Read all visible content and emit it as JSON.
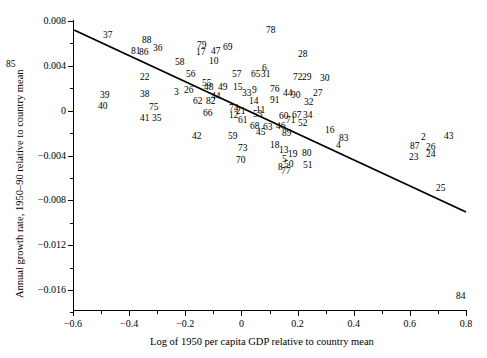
{
  "axes": {
    "x": {
      "label": "Log of 1950 per capita GDP relative to country mean",
      "ticks": [
        "-0.6",
        "-0.4",
        "-0.2",
        "0",
        "0.2",
        "0.4",
        "0.6",
        "0.8"
      ],
      "tickvalues": [
        -0.6,
        -0.4,
        -0.2,
        0,
        0.2,
        0.4,
        0.6,
        0.8
      ],
      "min": -0.6,
      "max": 0.8
    },
    "y": {
      "label": "Annual growth rate, 1950–90 relative to country mean",
      "ticks": [
        "0.008",
        "0.004",
        "0",
        "-0.004",
        "-0.008",
        "-0.012",
        "-0.016"
      ],
      "tickvalues": [
        0.008,
        0.004,
        0,
        -0.004,
        -0.008,
        -0.012,
        -0.016
      ],
      "min": -0.018,
      "max": 0.008
    }
  },
  "chart_data": {
    "type": "scatter",
    "title": "",
    "xlabel": "Log of 1950 per capita GDP relative to country mean",
    "ylabel": "Annual growth rate, 1950–90 relative to country mean",
    "xlim": [
      -0.6,
      0.8
    ],
    "ylim": [
      -0.018,
      0.008
    ],
    "grid": false,
    "legend": null,
    "marker_style": "numeric-label",
    "fit_line": {
      "type": "linear-regression",
      "x": [
        -0.6,
        0.8
      ],
      "y": [
        0.0065,
        -0.0098
      ],
      "slope": -0.01164,
      "intercept": -0.0017
    },
    "points": [
      {
        "label": "85",
        "x": -0.593,
        "y": 0.0043
      },
      {
        "label": "37",
        "x": -0.474,
        "y": 0.007
      },
      {
        "label": "81",
        "x": -0.402,
        "y": 0.0055
      },
      {
        "label": "88",
        "x": -0.366,
        "y": 0.0063
      },
      {
        "label": "86",
        "x": -0.377,
        "y": 0.0053
      },
      {
        "label": "36",
        "x": -0.345,
        "y": 0.0055
      },
      {
        "label": "22",
        "x": -0.373,
        "y": 0.0032
      },
      {
        "label": "58",
        "x": -0.302,
        "y": 0.0047
      },
      {
        "label": "79",
        "x": -0.259,
        "y": 0.0059
      },
      {
        "label": "17",
        "x": -0.256,
        "y": 0.0053
      },
      {
        "label": "47",
        "x": -0.227,
        "y": 0.0053
      },
      {
        "label": "69",
        "x": -0.202,
        "y": 0.0056
      },
      {
        "label": "10",
        "x": -0.231,
        "y": 0.0046
      },
      {
        "label": "39",
        "x": -0.48,
        "y": 0.0012
      },
      {
        "label": "40",
        "x": -0.484,
        "y": 0.0003
      },
      {
        "label": "38",
        "x": -0.373,
        "y": 0.0013
      },
      {
        "label": "75",
        "x": -0.355,
        "y": -0.0006
      },
      {
        "label": "41",
        "x": -0.373,
        "y": -0.0016
      },
      {
        "label": "35",
        "x": -0.348,
        "y": -0.0016
      },
      {
        "label": "56",
        "x": -0.291,
        "y": 0.0037
      },
      {
        "label": "55",
        "x": -0.259,
        "y": 0.003
      },
      {
        "label": "3",
        "x": -0.302,
        "y": 0.0014
      },
      {
        "label": "26",
        "x": -0.277,
        "y": 0.0013
      },
      {
        "label": "57",
        "x": -0.166,
        "y": 0.0037
      },
      {
        "label": "6",
        "x": -0.105,
        "y": 0.0041
      },
      {
        "label": "65",
        "x": -0.127,
        "y": 0.0036
      },
      {
        "label": "31",
        "x": -0.108,
        "y": 0.0036
      },
      {
        "label": "28",
        "x": -0.033,
        "y": 0.0049
      },
      {
        "label": "78",
        "x": -0.072,
        "y": 0.0076
      },
      {
        "label": "48",
        "x": -0.188,
        "y": 0.0023
      },
      {
        "label": "49",
        "x": -0.159,
        "y": 0.0023
      },
      {
        "label": "15",
        "x": -0.13,
        "y": 0.0023
      },
      {
        "label": "44",
        "x": -0.173,
        "y": 0.0013
      },
      {
        "label": "62",
        "x": -0.209,
        "y": 0.0007
      },
      {
        "label": "82",
        "x": -0.184,
        "y": 0.0007
      },
      {
        "label": "66",
        "x": -0.191,
        "y": -0.0004
      },
      {
        "label": "33",
        "x": -0.112,
        "y": 0.0016
      },
      {
        "label": "9",
        "x": -0.094,
        "y": 0.0019
      },
      {
        "label": "76",
        "x": -0.058,
        "y": 0.0021
      },
      {
        "label": "14",
        "x": -0.098,
        "y": 0.0009
      },
      {
        "label": "91",
        "x": -0.058,
        "y": 0.001
      },
      {
        "label": "44b",
        "x": -0.033,
        "y": 0.0016
      },
      {
        "label": "74",
        "x": -0.141,
        "y": 0.0001
      },
      {
        "label": "21",
        "x": -0.127,
        "y": -0.0003
      },
      {
        "label": "11",
        "x": -0.087,
        "y": -0.0002
      },
      {
        "label": "12",
        "x": -0.141,
        "y": -0.0008
      },
      {
        "label": "61",
        "x": -0.123,
        "y": -0.0012
      },
      {
        "label": "72",
        "x": 0.008,
        "y": 0.0035
      },
      {
        "label": "29",
        "x": 0.026,
        "y": 0.0035
      },
      {
        "label": "30",
        "x": 0.062,
        "y": 0.0034
      },
      {
        "label": "90",
        "x": 0.004,
        "y": 0.0013
      },
      {
        "label": "27",
        "x": 0.048,
        "y": 0.0014
      },
      {
        "label": "32",
        "x": 0.03,
        "y": 0.0007
      },
      {
        "label": "53",
        "x": -0.051,
        "y": -0.0004
      },
      {
        "label": "60",
        "x": 0.001,
        "y": -0.0008
      },
      {
        "label": "67",
        "x": 0.026,
        "y": -0.0007
      },
      {
        "label": "34",
        "x": 0.048,
        "y": -0.0007
      },
      {
        "label": "52",
        "x": 0.037,
        "y": -0.0013
      },
      {
        "label": "68",
        "x": -0.04,
        "y": -0.0016
      },
      {
        "label": "63",
        "x": -0.015,
        "y": -0.0017
      },
      {
        "label": "46",
        "x": 0.012,
        "y": -0.0016
      },
      {
        "label": "89",
        "x": 0.026,
        "y": -0.0021
      },
      {
        "label": "45",
        "x": -0.026,
        "y": -0.0021
      },
      {
        "label": "42",
        "x": -0.184,
        "y": -0.0027
      },
      {
        "label": "59",
        "x": -0.112,
        "y": -0.0027
      },
      {
        "label": "73",
        "x": -0.091,
        "y": -0.0036
      },
      {
        "label": "70",
        "x": -0.094,
        "y": -0.0046
      },
      {
        "label": "18",
        "x": -0.026,
        "y": -0.0032
      },
      {
        "label": "13",
        "x": -0.008,
        "y": -0.0036
      },
      {
        "label": "5",
        "x": -0.001,
        "y": -0.0044
      },
      {
        "label": "19",
        "x": 0.012,
        "y": -0.0039
      },
      {
        "label": "80",
        "x": 0.041,
        "y": -0.0038
      },
      {
        "label": "8",
        "x": -0.008,
        "y": -0.0053
      },
      {
        "label": "50",
        "x": 0.004,
        "y": -0.0051
      },
      {
        "label": "77",
        "x": -0.001,
        "y": -0.0057
      },
      {
        "label": "51",
        "x": 0.041,
        "y": -0.0052
      },
      {
        "label": "16",
        "x": 0.126,
        "y": -0.0017
      },
      {
        "label": "83",
        "x": 0.155,
        "y": -0.0026
      },
      {
        "label": "4",
        "x": 0.148,
        "y": -0.0032
      },
      {
        "label": "2",
        "x": 0.383,
        "y": -0.0025
      },
      {
        "label": "43",
        "x": 0.433,
        "y": -0.0025
      },
      {
        "label": "87",
        "x": 0.354,
        "y": -0.0033
      },
      {
        "label": "26b",
        "x": 0.39,
        "y": -0.0034
      },
      {
        "label": "23",
        "x": 0.354,
        "y": -0.0042
      },
      {
        "label": "24",
        "x": 0.39,
        "y": -0.0041
      },
      {
        "label": "25",
        "x": 0.408,
        "y": -0.0071
      },
      {
        "label": "84",
        "x": 0.73,
        "y": -0.017
      },
      {
        "label": "71",
        "x": 0.012,
        "y": -0.0011
      },
      {
        "label": "7",
        "x": -0.141,
        "y": 0.0002
      }
    ]
  },
  "labels_rendered": [
    {
      "t": "85",
      "x": 6,
      "y": 60
    },
    {
      "t": "37",
      "x": 103,
      "y": 31
    },
    {
      "t": "81",
      "x": 131,
      "y": 47
    },
    {
      "t": "88",
      "x": 142,
      "y": 36
    },
    {
      "t": "86",
      "x": 139,
      "y": 48
    },
    {
      "t": "36",
      "x": 153,
      "y": 44
    },
    {
      "t": "22",
      "x": 140,
      "y": 73
    },
    {
      "t": "58",
      "x": 175,
      "y": 58
    },
    {
      "t": "79",
      "x": 197,
      "y": 41
    },
    {
      "t": "17",
      "x": 196,
      "y": 48
    },
    {
      "t": "47",
      "x": 211,
      "y": 47
    },
    {
      "t": "69",
      "x": 223,
      "y": 43
    },
    {
      "t": "10",
      "x": 209,
      "y": 57
    },
    {
      "t": "39",
      "x": 100,
      "y": 91
    },
    {
      "t": "40",
      "x": 98,
      "y": 102
    },
    {
      "t": "38",
      "x": 140,
      "y": 90
    },
    {
      "t": "75",
      "x": 149,
      "y": 103
    },
    {
      "t": "41",
      "x": 140,
      "y": 114
    },
    {
      "t": "35",
      "x": 152,
      "y": 114
    },
    {
      "t": "56",
      "x": 186,
      "y": 70
    },
    {
      "t": "55",
      "x": 202,
      "y": 79
    },
    {
      "t": "3",
      "x": 174,
      "y": 88
    },
    {
      "t": "26",
      "x": 184,
      "y": 86
    },
    {
      "t": "57",
      "x": 232,
      "y": 70
    },
    {
      "t": "6",
      "x": 262,
      "y": 64
    },
    {
      "t": "65",
      "x": 251,
      "y": 70
    },
    {
      "t": "31",
      "x": 261,
      "y": 70
    },
    {
      "t": "28",
      "x": 298,
      "y": 50
    },
    {
      "t": "78",
      "x": 266,
      "y": 26
    },
    {
      "t": "48",
      "x": 204,
      "y": 83
    },
    {
      "t": "49",
      "x": 218,
      "y": 83
    },
    {
      "t": "15",
      "x": 233,
      "y": 83
    },
    {
      "t": "44",
      "x": 211,
      "y": 92
    },
    {
      "t": "62",
      "x": 193,
      "y": 97
    },
    {
      "t": "82",
      "x": 206,
      "y": 97
    },
    {
      "t": "66",
      "x": 203,
      "y": 109
    },
    {
      "t": "33",
      "x": 242,
      "y": 89
    },
    {
      "t": "9",
      "x": 252,
      "y": 86
    },
    {
      "t": "76",
      "x": 270,
      "y": 85
    },
    {
      "t": "14",
      "x": 249,
      "y": 97
    },
    {
      "t": "91",
      "x": 270,
      "y": 96
    },
    {
      "t": "44",
      "x": 283,
      "y": 89
    },
    {
      "t": "74",
      "x": 229,
      "y": 104
    },
    {
      "t": "21",
      "x": 236,
      "y": 107
    },
    {
      "t": "11",
      "x": 256,
      "y": 106
    },
    {
      "t": "12",
      "x": 229,
      "y": 111
    },
    {
      "t": "61",
      "x": 238,
      "y": 116
    },
    {
      "t": "72",
      "x": 293,
      "y": 73
    },
    {
      "t": "29",
      "x": 302,
      "y": 73
    },
    {
      "t": "30",
      "x": 320,
      "y": 74
    },
    {
      "t": "90",
      "x": 291,
      "y": 91
    },
    {
      "t": "27",
      "x": 313,
      "y": 89
    },
    {
      "t": "32",
      "x": 304,
      "y": 98
    },
    {
      "t": "53",
      "x": 253,
      "y": 110
    },
    {
      "t": "60",
      "x": 279,
      "y": 112
    },
    {
      "t": "67",
      "x": 292,
      "y": 111
    },
    {
      "t": "34",
      "x": 303,
      "y": 111
    },
    {
      "t": "52",
      "x": 298,
      "y": 119
    },
    {
      "t": "71",
      "x": 286,
      "y": 116
    },
    {
      "t": "68",
      "x": 250,
      "y": 122
    },
    {
      "t": "63",
      "x": 263,
      "y": 123
    },
    {
      "t": "46",
      "x": 276,
      "y": 122
    },
    {
      "t": "89",
      "x": 282,
      "y": 129
    },
    {
      "t": "45",
      "x": 256,
      "y": 128
    },
    {
      "t": "42",
      "x": 192,
      "y": 132
    },
    {
      "t": "59",
      "x": 228,
      "y": 132
    },
    {
      "t": "73",
      "x": 238,
      "y": 144
    },
    {
      "t": "70",
      "x": 236,
      "y": 156
    },
    {
      "t": "18",
      "x": 270,
      "y": 141
    },
    {
      "t": "13",
      "x": 279,
      "y": 146
    },
    {
      "t": "5",
      "x": 282,
      "y": 155
    },
    {
      "t": "19",
      "x": 288,
      "y": 150
    },
    {
      "t": "80",
      "x": 302,
      "y": 149
    },
    {
      "t": "8",
      "x": 278,
      "y": 163
    },
    {
      "t": "50",
      "x": 284,
      "y": 160
    },
    {
      "t": "77",
      "x": 281,
      "y": 167
    },
    {
      "t": "51",
      "x": 303,
      "y": 161
    },
    {
      "t": "16",
      "x": 325,
      "y": 126
    },
    {
      "t": "83",
      "x": 339,
      "y": 134
    },
    {
      "t": "4",
      "x": 336,
      "y": 141
    },
    {
      "t": "2",
      "x": 421,
      "y": 133
    },
    {
      "t": "43",
      "x": 444,
      "y": 132
    },
    {
      "t": "87",
      "x": 410,
      "y": 142
    },
    {
      "t": "26",
      "x": 426,
      "y": 143
    },
    {
      "t": "23",
      "x": 409,
      "y": 153
    },
    {
      "t": "24",
      "x": 426,
      "y": 150
    },
    {
      "t": "25",
      "x": 436,
      "y": 184
    },
    {
      "t": "84",
      "x": 456,
      "y": 292
    }
  ]
}
